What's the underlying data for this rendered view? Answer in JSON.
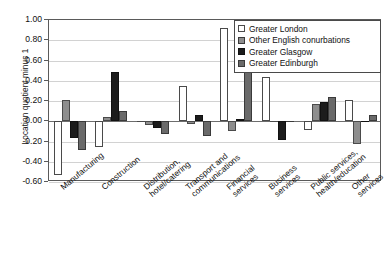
{
  "chart_data": {
    "type": "bar",
    "title": "",
    "xlabel": "",
    "ylabel": "Location quotient minus 1",
    "ylim": [
      -0.6,
      1.0
    ],
    "ytick_step": 0.2,
    "grid": true,
    "legend_position": "top-right",
    "categories": [
      "Manufacturing",
      "Construction",
      "Distribution,\nhotel/catering",
      "Transport and\ncommunications",
      "Financial\nservices",
      "Business\nservices",
      "Public services,\nhealth/education",
      "Other\nservices"
    ],
    "ytick_labels": [
      "1.00",
      "0.80",
      "0.60",
      "0.40",
      "0.20",
      "0.00",
      "-0.20",
      "-0.40",
      "-0.60"
    ],
    "ytick_values": [
      1.0,
      0.8,
      0.6,
      0.4,
      0.2,
      0.0,
      -0.2,
      -0.4,
      -0.6
    ],
    "series": [
      {
        "name": "Greater London",
        "color": "#ffffff",
        "values": [
          -0.53,
          -0.25,
          0.0,
          0.35,
          0.92,
          0.44,
          -0.09,
          0.21
        ]
      },
      {
        "name": "Other English conurbations",
        "color": "#8e8e8e",
        "values": [
          0.21,
          0.04,
          -0.04,
          -0.03,
          -0.1,
          0.0,
          0.17,
          -0.22
        ]
      },
      {
        "name": "Greater Glasgow",
        "color": "#1c1c1c",
        "values": [
          -0.17,
          0.49,
          -0.07,
          0.06,
          0.02,
          -0.19,
          0.19,
          0.0
        ]
      },
      {
        "name": "Greater Edinburgh",
        "color": "#6a6a6a",
        "values": [
          -0.28,
          0.1,
          -0.13,
          -0.15,
          0.74,
          0.0,
          0.24,
          0.06
        ]
      }
    ]
  },
  "legend": {
    "items": [
      {
        "label": "Greater London",
        "color": "#ffffff"
      },
      {
        "label": "Other English conurbations",
        "color": "#8e8e8e"
      },
      {
        "label": "Greater Glasgow",
        "color": "#1c1c1c"
      },
      {
        "label": "Greater Edinburgh",
        "color": "#6a6a6a"
      }
    ]
  }
}
